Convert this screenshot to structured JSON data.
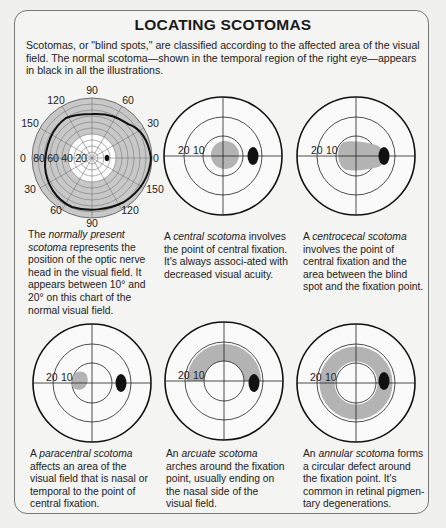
{
  "title": "LOCATING SCOTOMAS",
  "intro": "Scotomas, or \"blind spots,\" are classified according to the affected area of the visual field. The normal scotoma—shown in the temporal region of the right eye—appears in black in all the illustrations.",
  "perimeter_chart": {
    "angle_labels": {
      "top": "90",
      "top_left": "120",
      "top_right": "60",
      "left_upper": "150",
      "right_upper": "30",
      "left": "0",
      "right": "0",
      "left_lower": "30",
      "right_lower": "150",
      "bottom_left": "60",
      "bottom_right": "120",
      "bottom": "90"
    },
    "radial_labels": [
      "80",
      "60",
      "40",
      "20"
    ]
  },
  "ring_labels": {
    "outer": "20",
    "inner": "10"
  },
  "colors": {
    "scotoma_gray": "#b3b3b3",
    "blind_spot": "#111111",
    "frame": "#777777"
  },
  "panels": [
    {
      "id": "normal",
      "caption_pre": "The ",
      "caption_term": "normally present scotoma",
      "caption_post": " represents the position of the optic nerve head in the visual field. It appears between 10° and 20° on this chart of the normal visual field."
    },
    {
      "id": "central",
      "caption_pre": "A ",
      "caption_term": "central scotoma",
      "caption_post": " involves the point of central fixation. It's always associ-ated with decreased visual acuity."
    },
    {
      "id": "centrocecal",
      "caption_pre": "A ",
      "caption_term": "centrocecal scotoma",
      "caption_post": " involves the point of central fixation and the area between the blind spot and the fixation point."
    },
    {
      "id": "paracentral",
      "caption_pre": "A ",
      "caption_term": "paracentral scotoma",
      "caption_post": " affects an area of the visual field that is nasal or temporal to the point of central fixation."
    },
    {
      "id": "arcuate",
      "caption_pre": "An ",
      "caption_term": "arcuate scotoma",
      "caption_post": " arches around the fixation point, usually ending on the nasal side of the visual field."
    },
    {
      "id": "annular",
      "caption_pre": "An ",
      "caption_term": "annular scotoma",
      "caption_post": " forms a circular defect around the fixation point. It's common in retinal pigmen-tary degenerations."
    }
  ]
}
